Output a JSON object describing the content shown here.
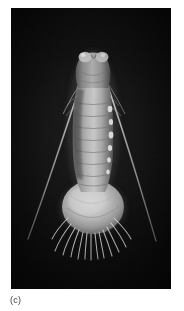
{
  "figure": {
    "caption": "(c)",
    "panel_label": "c",
    "background_color": "#080808",
    "specimen_color": "#c9c9c9",
    "caption_color": "#3b3b3b",
    "page_background": "#ffffff"
  },
  "photo": {
    "x": 11,
    "y": 8,
    "width": 160,
    "height": 281,
    "alt_text": "Dark-field photomicrograph of a pale segmented crustacean larva viewed from above, with two long slender antennae extending diagonally outward and a bulbous telson fringed with radiating setae."
  },
  "specimen": {
    "parts": [
      {
        "name": "head",
        "label": "cephalon"
      },
      {
        "name": "eye-lobe-left",
        "label": "eye lobe (left)"
      },
      {
        "name": "eye-lobe-right",
        "label": "eye lobe (right)"
      },
      {
        "name": "thorax",
        "label": "thorax"
      },
      {
        "name": "abdomen-segments",
        "label": "abdominal segments"
      },
      {
        "name": "telson",
        "label": "telson"
      },
      {
        "name": "setae-fan",
        "label": "setae fan"
      },
      {
        "name": "antenna-left",
        "label": "antenna (left)"
      },
      {
        "name": "antenna-right",
        "label": "antenna (right)"
      }
    ],
    "segment_count": 9,
    "setae_count": 13
  }
}
